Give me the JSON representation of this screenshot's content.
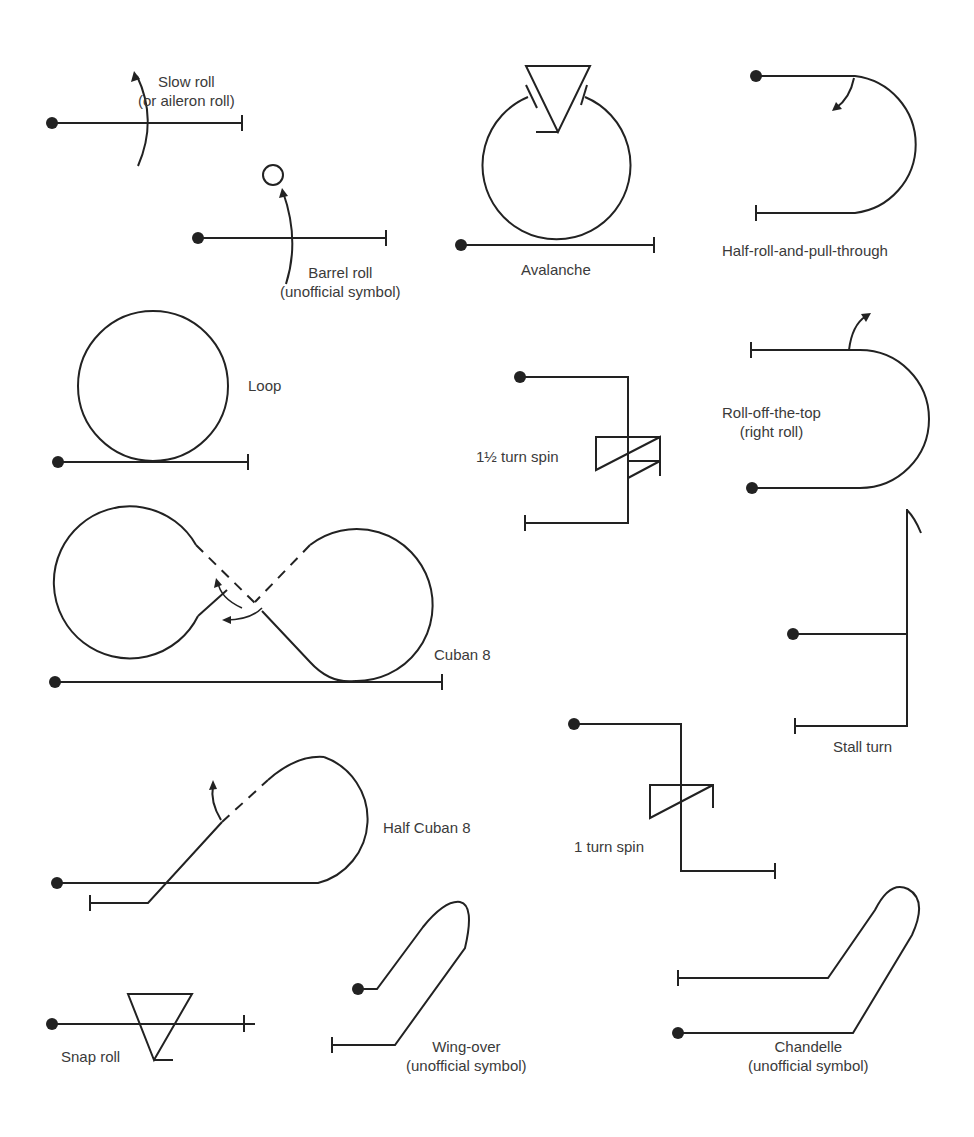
{
  "figure": {
    "legend": {
      "start_marker": "filled-dot",
      "end_marker": "perpendicular-bar"
    },
    "maneuvers": [
      {
        "id": "slow-roll",
        "label": "Slow roll",
        "sublabel": "(or aileron roll)"
      },
      {
        "id": "barrel-roll",
        "label": "Barrel roll",
        "sublabel": "(unofficial symbol)"
      },
      {
        "id": "avalanche",
        "label": "Avalanche",
        "sublabel": ""
      },
      {
        "id": "half-roll-and-pull-through",
        "label": "Half-roll-and-pull-through",
        "sublabel": ""
      },
      {
        "id": "loop",
        "label": "Loop",
        "sublabel": ""
      },
      {
        "id": "one-and-half-turn-spin",
        "label": "1½ turn spin",
        "sublabel": ""
      },
      {
        "id": "roll-off-the-top",
        "label": "Roll-off-the-top",
        "sublabel": "(right roll)"
      },
      {
        "id": "cuban-8",
        "label": "Cuban 8",
        "sublabel": ""
      },
      {
        "id": "stall-turn",
        "label": "Stall turn",
        "sublabel": ""
      },
      {
        "id": "half-cuban-8",
        "label": "Half Cuban 8",
        "sublabel": ""
      },
      {
        "id": "one-turn-spin",
        "label": "1 turn spin",
        "sublabel": ""
      },
      {
        "id": "snap-roll",
        "label": "Snap roll",
        "sublabel": ""
      },
      {
        "id": "wing-over",
        "label": "Wing-over",
        "sublabel": "(unofficial symbol)"
      },
      {
        "id": "chandelle",
        "label": "Chandelle",
        "sublabel": "(unofficial symbol)"
      }
    ]
  }
}
